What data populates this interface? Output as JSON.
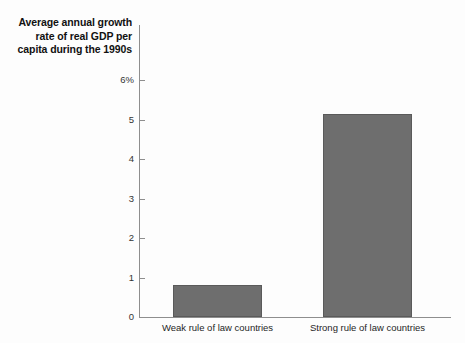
{
  "chart_data": {
    "type": "bar",
    "title": "Average annual growth rate of real GDP per capita during the 1990s",
    "title_lines": [
      "Average annual growth",
      "rate of real GDP per",
      "capita during the 1990s"
    ],
    "categories": [
      "Weak rule of law countries",
      "Strong rule of law countries"
    ],
    "values": [
      0.8,
      5.15
    ],
    "xlabel": "",
    "ylabel": "",
    "ylim": [
      0,
      6
    ],
    "yticks": [
      0,
      1,
      2,
      3,
      4,
      5,
      6
    ],
    "ytick_labels": [
      "0",
      "1",
      "2",
      "3",
      "4",
      "5",
      "6%"
    ],
    "grid": false,
    "legend": false,
    "bar_color": "#6e6e6e",
    "bar_edge_color": "#5a5a5a",
    "axis_color": "#8e8e8e",
    "background_color": "#fdfdfd"
  }
}
